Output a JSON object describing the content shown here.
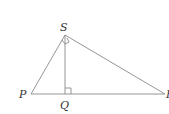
{
  "diagram": {
    "type": "right triangle with altitude",
    "vertices": {
      "S": {
        "label": "S",
        "x": 65,
        "y": 35
      },
      "P": {
        "label": "P",
        "x": 31,
        "y": 94
      },
      "Q": {
        "label": "Q",
        "x": 65,
        "y": 94
      },
      "R": {
        "label": "R",
        "x": 165,
        "y": 94
      }
    },
    "segments": [
      "SP",
      "SR",
      "PR",
      "SQ"
    ],
    "right_angles": [
      "PSR",
      "SQR"
    ],
    "labels": {
      "S": "S",
      "P": "P",
      "Q": "Q",
      "R": "R"
    },
    "line_color": "#8a8a8a",
    "label_color": "#333333"
  }
}
